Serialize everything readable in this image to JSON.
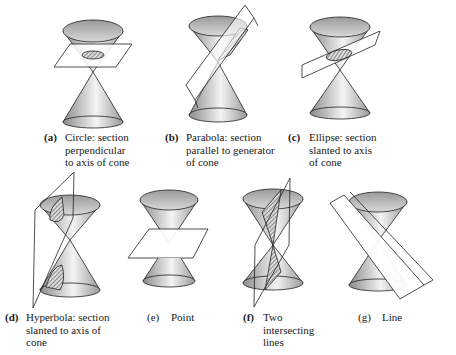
{
  "figure": {
    "panels": [
      {
        "id": "a",
        "label": "(a)",
        "caption": "Circle: section\nperpendicular\nto axis of cone",
        "section": "circle"
      },
      {
        "id": "b",
        "label": "(b)",
        "caption": "Parabola: section\nparallel to generator\nof cone",
        "section": "parabola"
      },
      {
        "id": "c",
        "label": "(c)",
        "caption": "Ellipse: section\nslanted to axis\nof cone",
        "section": "ellipse"
      },
      {
        "id": "d",
        "label": "(d)",
        "caption": "Hyperbola: section\nslanted to axis of\ncone",
        "section": "hyperbola"
      },
      {
        "id": "e",
        "label": "(e)",
        "caption": "Point",
        "section": "point"
      },
      {
        "id": "f",
        "label": "(f)",
        "caption": "Two\nintersecting\nlines",
        "section": "two-intersecting-lines"
      },
      {
        "id": "g",
        "label": "(g)",
        "caption": "Line",
        "section": "line"
      }
    ],
    "colors": {
      "cone_dark": "#8a8a8a",
      "cone_light": "#f2f2f2",
      "outline": "#222222",
      "hatch": "#444444"
    }
  }
}
